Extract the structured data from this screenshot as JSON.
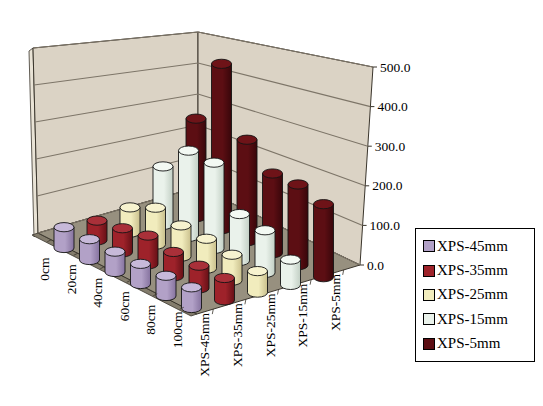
{
  "chart_data": {
    "type": "3d-cylinder-bar",
    "title": "",
    "depth_categories": [
      "0cm",
      "20cm",
      "40cm",
      "60cm",
      "80cm",
      "100cm"
    ],
    "series": [
      {
        "name": "XPS-45mm",
        "color": "#B2A1C7",
        "top_color": "#C7B9D9",
        "shade_color": "#86739F",
        "values": [
          65,
          62,
          58,
          55,
          53,
          52
        ]
      },
      {
        "name": "XPS-35mm",
        "color": "#9E222A",
        "top_color": "#A93039",
        "shade_color": "#661016",
        "values": [
          60,
          70,
          80,
          65,
          58,
          55
        ]
      },
      {
        "name": "XPS-25mm",
        "color": "#F1ECBD",
        "top_color": "#F7F3CF",
        "shade_color": "#C9BF8C",
        "values": [
          75,
          105,
          85,
          78,
          65,
          52
        ]
      },
      {
        "name": "XPS-15mm",
        "color": "#EAF2EB",
        "top_color": "#F3F9F3",
        "shade_color": "#C2CFC4",
        "values": [
          170,
          240,
          230,
          120,
          105,
          60
        ]
      },
      {
        "name": "XPS-5mm",
        "color": "#5C0E13",
        "top_color": "#6E1318",
        "shade_color": "#38060A",
        "values": [
          280,
          450,
          265,
          200,
          195,
          170
        ]
      }
    ],
    "value_axis": {
      "min": 0,
      "max": 500,
      "step": 100,
      "tick_labels": [
        "0.0",
        "100.0",
        "200.0",
        "300.0",
        "400.0",
        "500.0"
      ]
    },
    "legend": {
      "position": "right"
    },
    "colors": {
      "wall": "#DBD3C5",
      "wall_edge_strip": "#E9E3D6",
      "floor": "#97907F",
      "floor_side": "#837C6C",
      "gridline": "#7D7568",
      "axis_line": "#3A352C",
      "text": "#000000",
      "background": "#FFFFFF"
    }
  }
}
